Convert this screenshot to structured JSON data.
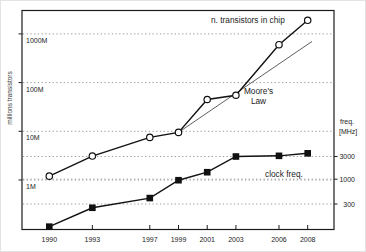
{
  "figure": {
    "background": "#ffffff",
    "frame_color": "#1c1c1c",
    "grid_color": "#9a9a9a",
    "text_color": "#1c1c1c",
    "muted_text_color": "#3c3c3c",
    "moore_line_color": "#4d4d4d",
    "series_line_color": "#111111",
    "circle_marker_fill": "#ffffff",
    "square_marker_fill": "#111111"
  },
  "labels": {
    "y_left_axis": "millions transistors",
    "y_right_line1": "freq.",
    "y_right_line2": "[MHz]",
    "series_transistors": "n. transistors in chip",
    "series_clock": "clock freq.",
    "moore_line1": "Moore's",
    "moore_line2": "Law"
  },
  "chart_data": {
    "type": "line",
    "title": "",
    "x": [
      1990,
      1993,
      1997,
      1999,
      2001,
      2003,
      2006,
      2008
    ],
    "x_tick_labels": [
      "1990",
      "1993",
      "1997",
      "1999",
      "2001",
      "2003",
      "2006",
      "2008"
    ],
    "x_range": [
      1990,
      2008
    ],
    "grid": "dotted horizontal at every labeled tick of both y axes",
    "legend": "none (series labeled by in-plot annotations)",
    "series": [
      {
        "name": "n. transistors in chip",
        "axis": "left",
        "units": "millions of transistors",
        "marker": "open-circle",
        "values_millions": [
          1.2,
          3.1,
          7.5,
          9.5,
          45,
          55,
          600,
          1900
        ]
      },
      {
        "name": "clock freq.",
        "axis": "right",
        "units": "MHz",
        "marker": "filled-square",
        "values_mhz": [
          100,
          250,
          400,
          950,
          1400,
          3000,
          3100,
          3500
        ]
      }
    ],
    "moore_law_reference_line": {
      "name": "Moore's Law",
      "from": {
        "year": 1999,
        "millions": 9.5
      },
      "to": {
        "year": 2008.3,
        "millions": 700
      }
    },
    "left_axis": {
      "label": "millions transistors",
      "scale": "log",
      "tick_labels": [
        "1M",
        "10M",
        "100M",
        "1000M"
      ],
      "tick_values_millions": [
        1,
        10,
        100,
        1000
      ],
      "tick_label_position": "inside plot, below gridline"
    },
    "right_axis": {
      "label": "freq. [MHz]",
      "scale": "log",
      "tick_labels": [
        "3000",
        "1000",
        "300"
      ],
      "tick_values_mhz": [
        3000,
        1000,
        300
      ]
    }
  }
}
